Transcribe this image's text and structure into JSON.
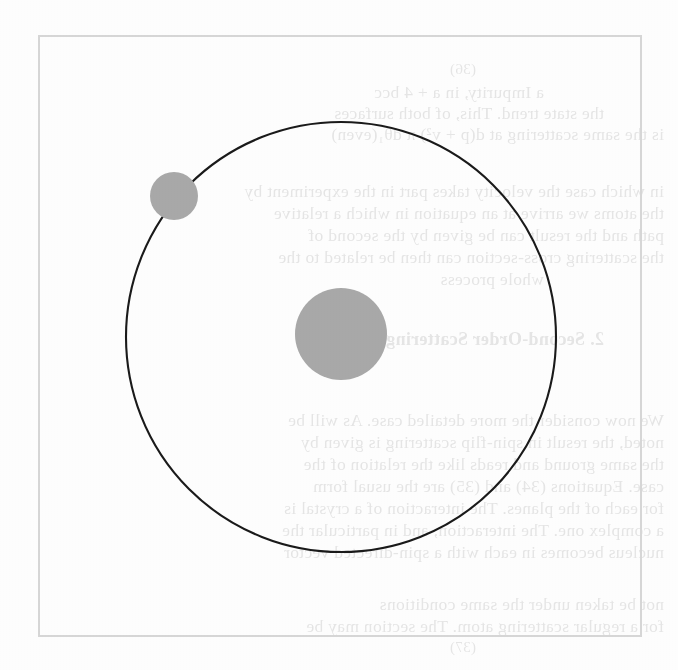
{
  "page": {
    "width": 678,
    "height": 670,
    "background_color": "#fdfdfd",
    "kind": "scanned-book-figure"
  },
  "figure": {
    "frame": {
      "x": 38,
      "y": 35,
      "width": 604,
      "height": 602,
      "stroke_color": "#d6d6d6",
      "stroke_width": 2
    },
    "orbit_path": {
      "label": "orbit-circle",
      "center_x": 341,
      "center_y": 337,
      "radius": 215,
      "stroke_color": "#1a1a1a",
      "stroke_width": 2.1,
      "fill": "none"
    },
    "central_body": {
      "label": "central-body",
      "center_x": 341,
      "center_y": 334,
      "radius": 46,
      "fill_color": "#a8a8a8"
    },
    "orbiting_body": {
      "label": "orbiting-body",
      "center_x": 174,
      "center_y": 196,
      "radius": 24,
      "fill_color": "#a8a8a8",
      "angle_degrees": 219
    }
  },
  "bleed_through_text": {
    "note": "faint mirrored show-through from the reverse side of the printed page",
    "opacity": 0.115,
    "color": "#2b2b2b",
    "lines": [
      {
        "text": "(36)",
        "indent": 3,
        "style": "small",
        "top": 62
      },
      {
        "text": "a Impurity, in a + 4 bcc",
        "indent": 2,
        "style": "normal",
        "top": 84
      },
      {
        "text": "the state trend. This, of both surfaces",
        "indent": 1,
        "style": "normal",
        "top": 105
      },
      {
        "text": "is the same scattering at d(p + v²) π dθ₁(even)",
        "indent": 0,
        "style": "normal",
        "top": 126
      },
      {
        "text": "in which case the velocity takes part in the experiment by",
        "indent": 0,
        "style": "normal",
        "top": 183
      },
      {
        "text": "the atoms we arrive at an equation in which a relative",
        "indent": 0,
        "style": "normal",
        "top": 205
      },
      {
        "text": "path and the result can be given by the second of",
        "indent": 0,
        "style": "normal",
        "top": 227
      },
      {
        "text": "the scattering cross-section can then be related to the",
        "indent": 0,
        "style": "normal",
        "top": 249
      },
      {
        "text": "whole process",
        "indent": 2,
        "style": "normal",
        "top": 271
      },
      {
        "text": "2. Second-Order Scattering",
        "indent": 1,
        "style": "heading",
        "top": 330
      },
      {
        "text": "We now consider the more detailed case. As will be",
        "indent": 0,
        "style": "normal",
        "top": 412
      },
      {
        "text": "noted, the result in spin-flip scattering is given by",
        "indent": 0,
        "style": "normal",
        "top": 434
      },
      {
        "text": "the same ground and reads like the relation of the",
        "indent": 0,
        "style": "normal",
        "top": 456
      },
      {
        "text": "case. Equations (34) and (35) are the usual form",
        "indent": 0,
        "style": "normal",
        "top": 478
      },
      {
        "text": "for each of the planes. The interaction of a crystal is",
        "indent": 0,
        "style": "normal",
        "top": 500
      },
      {
        "text": "a complex one. The interaction, and in particular the",
        "indent": 0,
        "style": "normal",
        "top": 522
      },
      {
        "text": "nucleus becomes in each with a spin-directed vector",
        "indent": 0,
        "style": "normal",
        "top": 544
      },
      {
        "text": "not be taken under the same conditions",
        "indent": 0,
        "style": "normal",
        "top": 596
      },
      {
        "text": "for a regular scattering atom. The section may be",
        "indent": 0,
        "style": "normal",
        "top": 618
      },
      {
        "text": "(37)",
        "indent": 3,
        "style": "small",
        "top": 640
      }
    ]
  }
}
